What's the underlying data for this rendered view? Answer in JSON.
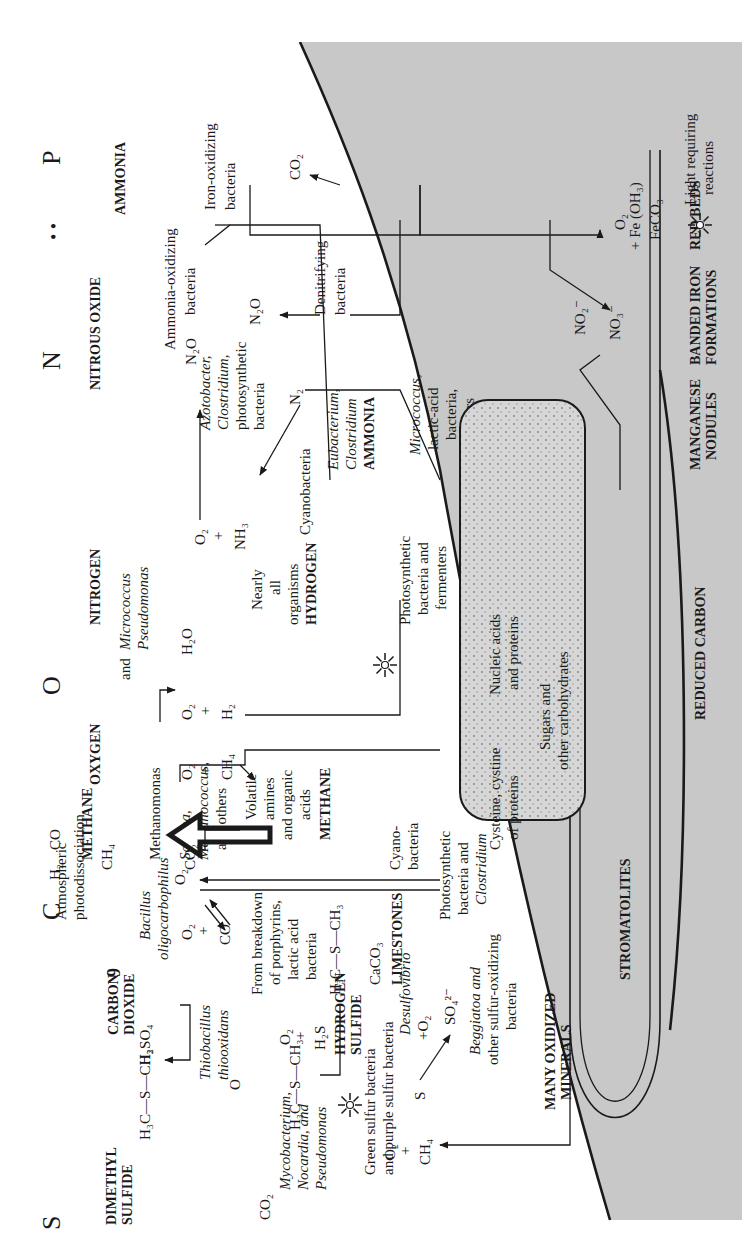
{
  "figure": {
    "orientation": "rotated 90 degrees counter-clockwise",
    "colors": {
      "sediment_fill": "#c8c8c8",
      "cell_fill": "#d9d9d9",
      "ink": "#1a1a1a",
      "paper": "#ffffff"
    }
  },
  "elements": {
    "P": "P",
    "N": "N",
    "O": "O",
    "C": "C",
    "S": "S"
  },
  "gases": {
    "ammonia": "AMMONIA",
    "nitrous_oxide": "NITROUS OXIDE",
    "nitrogen": "NITROGEN",
    "oxygen": "OXYGEN",
    "methane": "METHANE",
    "carbon_dioxide_1": "CARBON",
    "carbon_dioxide_2": "DIOXIDE",
    "dimethyl_sulfide_1": "DIMETHYL",
    "dimethyl_sulfide_2": "SULFIDE"
  },
  "methane_area": {
    "co": "CO",
    "h2": "H₂",
    "ch4": "CH₄",
    "atmospheric_1": "Atmospheric",
    "atmospheric_2": "photodissociation",
    "sulfur_symbol": "9"
  },
  "labels": {
    "iron_oxidizing_1": "Iron-oxidizing",
    "iron_oxidizing_2": "bacteria",
    "co2_iron": "CO₂",
    "ammonia_oxidizing_1": "Ammonia-oxidizing",
    "ammonia_oxidizing_2": "bacteria",
    "n2o_top": "N₂O",
    "azoto_1": "Azotobacter,",
    "azoto_2": "Clostridium,",
    "azoto_3": "photosynthetic",
    "azoto_4": "bacteria",
    "n2o_mid": "N₂O",
    "denitrifying_1": "Denitrifying",
    "denitrifying_2": "bacteria",
    "n2": "N₂",
    "cyanobacteria": "Cyanobacteria",
    "eubacterium_1": "Eubacterium,",
    "eubacterium_2": "Clostridium",
    "ammonia_layer": "AMMONIA",
    "o2_nh3_o2": "O₂",
    "o2_nh3_plus": "+",
    "nh3": "NH₃",
    "nearly_1": "Nearly",
    "nearly_2": "all",
    "nearly_3": "organisms",
    "hydrogen_layer": "HYDROGEN",
    "micrococcus_1": "Micrococcus",
    "micrococcus_2": "and",
    "micrococcus_3": "Pseudomonas",
    "h2o": "H₂O",
    "o2_h2_o2": "O₂",
    "o2_h2_plus": "+",
    "h2": "H₂",
    "methanomonas": "Methanomonas",
    "o2_ch4_o2": "O₂",
    "o2_ch4_plus": "+",
    "ch4": "CH₄",
    "sarcina_1": "Sarcina,",
    "sarcina_2": "Methanococcus,",
    "sarcina_3": "and others",
    "volatile_1": "Volatile",
    "volatile_2": "amines",
    "volatile_3": "and organic",
    "volatile_4": "acids",
    "methane_layer": "METHANE",
    "o2_arrow": "O₂",
    "co2_center": "CO₂",
    "bacillus_1": "Bacillus",
    "bacillus_2": "oligocarbophilus",
    "o2_co_o2": "O₂",
    "o2_co_plus": "+",
    "co": "CO",
    "breakdown_1": "From breakdown",
    "breakdown_2": "of porphyrins,",
    "breakdown_3": "lactic acid",
    "breakdown_4": "bacteria",
    "dms_bottom": "H₃C—S—CH₃",
    "caco3": "CaCO₃",
    "limestones": "LIMESTONES",
    "thiobacillus_1": "Thiobacillus",
    "thiobacillus_2": "thiooxidans",
    "h2so4": "H₂SO₄",
    "dms_top": "H₃C—S—CH₃",
    "o2_h2s_o2": "O₂",
    "o2_h2s_plus": "+",
    "h2s": "H₂S",
    "hydrogen_sulfide_1": "HYDROGEN",
    "hydrogen_sulfide_2": "SULFIDE",
    "dmso_o": "O",
    "dmso": "H₃C—S—CH₃",
    "green_sulfur_1": "Green sulfur bacteria",
    "green_sulfur_2": "and purple sulfur bacteria",
    "s": "S",
    "desulfovibrio": "Desulfovibrio",
    "plus_o2": "+O₂",
    "so4": "SO₄²⁻",
    "mycobacterium_1": "Mycobacterium,",
    "mycobacterium_2": "Nocardia, and",
    "mycobacterium_3": "Pseudomonas",
    "co2_top": "CO₂",
    "o2_ch4_right_o2": "O₂",
    "o2_ch4_right_plus": "+",
    "ch4_right": "CH₄"
  },
  "sediment": {
    "o2_fe_o2": "O₂",
    "fe_oh": "+ Fe (OH₃)",
    "feco3": "FeCO₃",
    "no2": "NO₂⁻",
    "no3": "NO₃⁻",
    "micrococcus_lactic_1": "Micrococcus,",
    "micrococcus_lactic_2": "lactic-acid",
    "micrococcus_lactic_3": "bacteria,",
    "micrococcus_lactic_4": "and others",
    "photo_fermenters_1": "Photosynthetic",
    "photo_fermenters_2": "bacteria and",
    "photo_fermenters_3": "fermenters",
    "cyanobacteria_1": "Cyano-",
    "cyanobacteria_2": "bacteria",
    "photo_clostridium_1": "Photosynthetic",
    "photo_clostridium_2": "bacteria and",
    "photo_clostridium_3": "Clostridium",
    "beggiatoa_1": "Beggiatoa and",
    "beggiatoa_2": "other sulfur-oxidizing",
    "beggiatoa_3": "bacteria",
    "many_oxidized_1": "MANY OXIDIZED",
    "many_oxidized_2": "MINERALS",
    "stromatolites": "STROMATOLITES",
    "red_beds": "RED BEDS",
    "banded_iron_1": "BANDED IRON",
    "banded_iron_2": "FORMATIONS",
    "manganese_1": "MANGANESE",
    "manganese_2": "NODULES",
    "reduced_carbon": "REDUCED CARBON"
  },
  "cell": {
    "nucleic_1": "Nucleic acids",
    "nucleic_2": "and proteins",
    "cysteine_1": "Cysteine, cystine",
    "cysteine_2": "of proteins",
    "sugars_1": "Sugars and",
    "sugars_2": "other carbohydrates"
  },
  "legend": {
    "icon": "sun-icon",
    "label_1": "Light requiring",
    "label_2": "reactions"
  }
}
